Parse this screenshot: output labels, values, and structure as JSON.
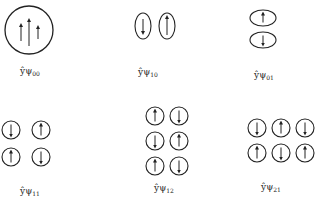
{
  "diagram": {
    "stroke_color": "#222222",
    "background": "#ffffff",
    "modes": [
      {
        "id": "psi00",
        "label_prefix": "ŷψ",
        "label_sub": "00",
        "label_pos": [
          30,
          66
        ],
        "shape": "circle",
        "cells": [
          {
            "cx": 29,
            "cy": 30,
            "rx": 24,
            "ry": 24,
            "arrows": [
              {
                "x": 21,
                "dir": "up",
                "len": 16
              },
              {
                "x": 29,
                "dir": "up",
                "len": 26
              },
              {
                "x": 38,
                "dir": "up",
                "len": 12
              }
            ]
          }
        ]
      },
      {
        "id": "psi10",
        "label_prefix": "ŷψ",
        "label_sub": "10",
        "label_pos": [
          148,
          67
        ],
        "shape": "ellipse",
        "cells": [
          {
            "cx": 143,
            "cy": 26,
            "rx": 8,
            "ry": 13,
            "arrows": [
              {
                "dir": "down",
                "len": 14
              }
            ]
          },
          {
            "cx": 167,
            "cy": 26,
            "rx": 8,
            "ry": 13,
            "arrows": [
              {
                "dir": "up",
                "len": 18
              }
            ]
          }
        ]
      },
      {
        "id": "psi01",
        "label_prefix": "ŷψ",
        "label_sub": "01",
        "label_pos": [
          264,
          70
        ],
        "shape": "ellipse",
        "cells": [
          {
            "cx": 263,
            "cy": 18,
            "rx": 13,
            "ry": 8,
            "arrows": [
              {
                "dir": "up",
                "len": 9
              }
            ]
          },
          {
            "cx": 263,
            "cy": 40,
            "rx": 13,
            "ry": 8,
            "arrows": [
              {
                "dir": "down",
                "len": 9
              }
            ]
          }
        ]
      },
      {
        "id": "psi11",
        "label_prefix": "ŷψ",
        "label_sub": "11",
        "label_pos": [
          30,
          186
        ],
        "shape": "circle",
        "cells": [
          {
            "cx": 11,
            "cy": 130,
            "rx": 9,
            "ry": 9,
            "arrows": [
              {
                "dir": "down",
                "len": 11
              }
            ]
          },
          {
            "cx": 41,
            "cy": 130,
            "rx": 9,
            "ry": 9,
            "arrows": [
              {
                "dir": "up",
                "len": 11
              }
            ]
          },
          {
            "cx": 11,
            "cy": 157,
            "rx": 9,
            "ry": 9,
            "arrows": [
              {
                "dir": "up",
                "len": 11
              }
            ]
          },
          {
            "cx": 41,
            "cy": 157,
            "rx": 9,
            "ry": 9,
            "arrows": [
              {
                "dir": "down",
                "len": 11
              }
            ]
          }
        ]
      },
      {
        "id": "psi12",
        "label_prefix": "ŷψ",
        "label_sub": "12",
        "label_pos": [
          164,
          183
        ],
        "shape": "circle",
        "cells": [
          {
            "cx": 155,
            "cy": 116,
            "rx": 9,
            "ry": 9,
            "arrows": [
              {
                "dir": "up",
                "len": 11
              }
            ]
          },
          {
            "cx": 179,
            "cy": 116,
            "rx": 9,
            "ry": 9,
            "arrows": [
              {
                "dir": "down",
                "len": 11
              }
            ]
          },
          {
            "cx": 155,
            "cy": 141,
            "rx": 9,
            "ry": 9,
            "arrows": [
              {
                "dir": "down",
                "len": 11
              }
            ]
          },
          {
            "cx": 179,
            "cy": 141,
            "rx": 9,
            "ry": 9,
            "arrows": [
              {
                "dir": "up",
                "len": 11
              }
            ]
          },
          {
            "cx": 155,
            "cy": 166,
            "rx": 9,
            "ry": 9,
            "arrows": [
              {
                "dir": "up",
                "len": 11
              }
            ]
          },
          {
            "cx": 179,
            "cy": 166,
            "rx": 9,
            "ry": 9,
            "arrows": [
              {
                "dir": "down",
                "len": 11
              }
            ]
          }
        ]
      },
      {
        "id": "psi21",
        "label_prefix": "ŷψ",
        "label_sub": "21",
        "label_pos": [
          271,
          182
        ],
        "shape": "circle",
        "cells": [
          {
            "cx": 257,
            "cy": 128,
            "rx": 9,
            "ry": 9,
            "arrows": [
              {
                "dir": "down",
                "len": 11
              }
            ]
          },
          {
            "cx": 281,
            "cy": 128,
            "rx": 9,
            "ry": 9,
            "arrows": [
              {
                "dir": "up",
                "len": 11
              }
            ]
          },
          {
            "cx": 305,
            "cy": 128,
            "rx": 9,
            "ry": 9,
            "arrows": [
              {
                "dir": "down",
                "len": 11
              }
            ]
          },
          {
            "cx": 257,
            "cy": 153,
            "rx": 9,
            "ry": 9,
            "arrows": [
              {
                "dir": "up",
                "len": 11
              }
            ]
          },
          {
            "cx": 281,
            "cy": 153,
            "rx": 9,
            "ry": 9,
            "arrows": [
              {
                "dir": "down",
                "len": 11
              }
            ]
          },
          {
            "cx": 305,
            "cy": 153,
            "rx": 9,
            "ry": 9,
            "arrows": [
              {
                "dir": "up",
                "len": 11
              }
            ]
          }
        ]
      }
    ]
  }
}
